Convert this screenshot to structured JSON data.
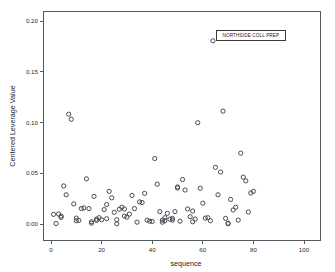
{
  "chart_data": {
    "type": "scatter",
    "title": "",
    "xlabel": "sequence",
    "ylabel": "Centered Leverage Value",
    "xlim": [
      -4,
      104
    ],
    "ylim": [
      -0.012,
      0.213
    ],
    "xticks": [
      0,
      20,
      40,
      60,
      80,
      100
    ],
    "xticklabels": [
      "0",
      "20",
      "40",
      "60",
      "80",
      "100"
    ],
    "yticks": [
      0.0,
      0.05,
      0.1,
      0.15,
      0.2
    ],
    "yticklabels": [
      "0.00",
      "0.05",
      "0.10",
      "0.15",
      "0.20"
    ],
    "grid": false,
    "legend": null,
    "marker": "open-circle",
    "marker_color": "#4a4a52",
    "annotations": [
      {
        "text": "NORTHSIDE COLL PREP",
        "x": 64,
        "y": 0.18,
        "boxed": true
      }
    ],
    "points": [
      {
        "x": 1,
        "y": 0.0095
      },
      {
        "x": 2,
        "y": 0.0005
      },
      {
        "x": 3,
        "y": 0.0098
      },
      {
        "x": 4,
        "y": 0.0078
      },
      {
        "x": 4,
        "y": 0.0065
      },
      {
        "x": 5,
        "y": 0.0375
      },
      {
        "x": 6,
        "y": 0.0288
      },
      {
        "x": 7,
        "y": 0.1082
      },
      {
        "x": 8,
        "y": 0.1032
      },
      {
        "x": 9,
        "y": 0.0198
      },
      {
        "x": 10,
        "y": 0.0058
      },
      {
        "x": 10,
        "y": 0.0032
      },
      {
        "x": 11,
        "y": 0.0035
      },
      {
        "x": 12,
        "y": 0.0152
      },
      {
        "x": 13,
        "y": 0.0158
      },
      {
        "x": 14,
        "y": 0.0445
      },
      {
        "x": 15,
        "y": 0.0152
      },
      {
        "x": 16,
        "y": 0.0022
      },
      {
        "x": 16,
        "y": 0.0008
      },
      {
        "x": 17,
        "y": 0.0272
      },
      {
        "x": 18,
        "y": 0.0048
      },
      {
        "x": 18,
        "y": 0.0035
      },
      {
        "x": 19,
        "y": 0.0062
      },
      {
        "x": 20,
        "y": 0.0042
      },
      {
        "x": 21,
        "y": 0.0142
      },
      {
        "x": 22,
        "y": 0.0192
      },
      {
        "x": 22,
        "y": 0.0052
      },
      {
        "x": 23,
        "y": 0.0322
      },
      {
        "x": 24,
        "y": 0.0258
      },
      {
        "x": 25,
        "y": 0.0115
      },
      {
        "x": 26,
        "y": 0.0042
      },
      {
        "x": 26,
        "y": 0.0002
      },
      {
        "x": 27,
        "y": 0.0145
      },
      {
        "x": 28,
        "y": 0.0165
      },
      {
        "x": 29,
        "y": 0.0148
      },
      {
        "x": 29,
        "y": 0.0078
      },
      {
        "x": 30,
        "y": 0.0068
      },
      {
        "x": 31,
        "y": 0.0098
      },
      {
        "x": 32,
        "y": 0.0282
      },
      {
        "x": 33,
        "y": 0.0152
      },
      {
        "x": 34,
        "y": 0.0018
      },
      {
        "x": 35,
        "y": 0.0218
      },
      {
        "x": 36,
        "y": 0.0212
      },
      {
        "x": 37,
        "y": 0.0302
      },
      {
        "x": 38,
        "y": 0.0038
      },
      {
        "x": 39,
        "y": 0.0028
      },
      {
        "x": 40,
        "y": 0.0025
      },
      {
        "x": 41,
        "y": 0.0645
      },
      {
        "x": 42,
        "y": 0.0392
      },
      {
        "x": 43,
        "y": 0.0122
      },
      {
        "x": 44,
        "y": 0.0038
      },
      {
        "x": 44,
        "y": 0.0018
      },
      {
        "x": 45,
        "y": 0.0062
      },
      {
        "x": 45,
        "y": 0.0032
      },
      {
        "x": 46,
        "y": 0.0105
      },
      {
        "x": 47,
        "y": 0.0048
      },
      {
        "x": 48,
        "y": 0.0055
      },
      {
        "x": 48,
        "y": 0.0038
      },
      {
        "x": 49,
        "y": 0.0122
      },
      {
        "x": 50,
        "y": 0.0365
      },
      {
        "x": 50,
        "y": 0.0355
      },
      {
        "x": 51,
        "y": 0.0028
      },
      {
        "x": 52,
        "y": 0.0438
      },
      {
        "x": 53,
        "y": 0.0335
      },
      {
        "x": 54,
        "y": 0.0148
      },
      {
        "x": 55,
        "y": 0.0072
      },
      {
        "x": 56,
        "y": 0.0128
      },
      {
        "x": 56,
        "y": 0.0022
      },
      {
        "x": 57,
        "y": 0.0048
      },
      {
        "x": 58,
        "y": 0.0998
      },
      {
        "x": 59,
        "y": 0.0352
      },
      {
        "x": 60,
        "y": 0.0205
      },
      {
        "x": 61,
        "y": 0.0058
      },
      {
        "x": 62,
        "y": 0.0062
      },
      {
        "x": 63,
        "y": 0.0032
      },
      {
        "x": 64,
        "y": 0.1805
      },
      {
        "x": 65,
        "y": 0.0558
      },
      {
        "x": 66,
        "y": 0.0288
      },
      {
        "x": 67,
        "y": 0.0512
      },
      {
        "x": 68,
        "y": 0.1112
      },
      {
        "x": 69,
        "y": 0.0055
      },
      {
        "x": 70,
        "y": 0.0008
      },
      {
        "x": 70,
        "y": 0.0002
      },
      {
        "x": 71,
        "y": 0.0242
      },
      {
        "x": 72,
        "y": 0.0138
      },
      {
        "x": 73,
        "y": 0.0165
      },
      {
        "x": 74,
        "y": 0.0038
      },
      {
        "x": 75,
        "y": 0.0698
      },
      {
        "x": 76,
        "y": 0.0462
      },
      {
        "x": 77,
        "y": 0.0425
      },
      {
        "x": 78,
        "y": 0.0118
      },
      {
        "x": 79,
        "y": 0.0305
      },
      {
        "x": 80,
        "y": 0.0322
      }
    ]
  },
  "axes": {
    "x_title": "sequence",
    "y_title": "Centered Leverage Value"
  }
}
